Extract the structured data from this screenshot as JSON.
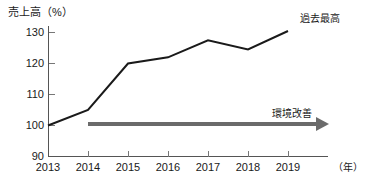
{
  "chart_data": {
    "type": "line",
    "title": "",
    "ylabel": "売上高（%）",
    "xlabel": "（年）",
    "categories": [
      "2013",
      "2014",
      "2015",
      "2016",
      "2017",
      "2018",
      "2019"
    ],
    "values": [
      100,
      105,
      120,
      122,
      127.5,
      124.5,
      130.5
    ],
    "series": [
      {
        "name": "売上高",
        "values": [
          100,
          105,
          120,
          122,
          127.5,
          124.5,
          130.5
        ]
      }
    ],
    "ylim": [
      90,
      130
    ],
    "yticks": [
      90,
      100,
      110,
      120,
      130
    ],
    "ytick_labels": [
      "90",
      "100",
      "110",
      "120",
      "130"
    ],
    "xtick_labels": [
      "2013",
      "2014",
      "2015",
      "2016",
      "2017",
      "2018",
      "2019"
    ],
    "grid": false,
    "legend": "none",
    "line_color": "#1a1a1a",
    "annotations": [
      {
        "id": "record-high",
        "text": "過去最高",
        "target_category": "2019",
        "target_value": 130.5
      },
      {
        "id": "environment-improvement",
        "text": "環境改善",
        "style": "arrow",
        "color": "#6b6b6b",
        "from_category": "2014",
        "to_category": "2019",
        "at_value": 99
      }
    ]
  },
  "axes": {
    "y_title": "売上高（%）",
    "x_unit": "（年）",
    "y_ticks": [
      {
        "label": "130",
        "value": 130
      },
      {
        "label": "120",
        "value": 120
      },
      {
        "label": "110",
        "value": 110
      },
      {
        "label": "100",
        "value": 100
      },
      {
        "label": "90",
        "value": 90
      }
    ],
    "x_ticks": [
      {
        "label": "2013"
      },
      {
        "label": "2014"
      },
      {
        "label": "2015"
      },
      {
        "label": "2016"
      },
      {
        "label": "2017"
      },
      {
        "label": "2018"
      },
      {
        "label": "2019"
      }
    ]
  },
  "annotations": {
    "record_high": "過去最高",
    "environment_improvement": "環境改善"
  }
}
